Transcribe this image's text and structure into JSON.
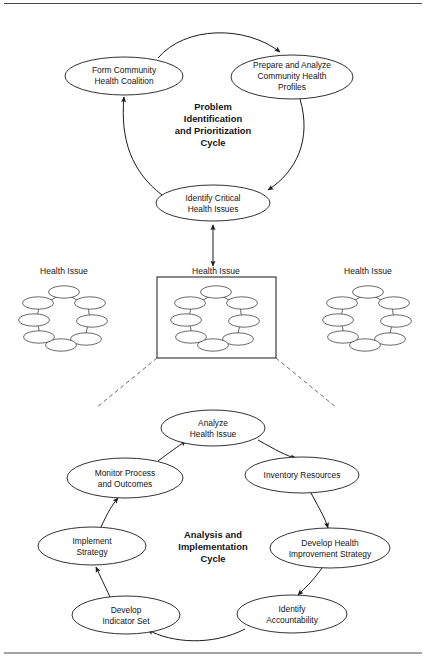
{
  "figure": {
    "top_rule": true,
    "bottom_rule": true,
    "background_color": "#ffffff",
    "line_color": "#1b1b1b"
  },
  "top_cycle": {
    "title_lines": [
      "Problem",
      "Identification",
      "and Prioritization",
      "Cycle"
    ],
    "nodes": [
      {
        "id": "form-coalition",
        "lines": [
          "Form Community",
          "Health Coalition"
        ],
        "cx": 124,
        "cy": 76,
        "rx": 59,
        "ry": 19
      },
      {
        "id": "prepare-profiles",
        "lines": [
          "Prepare and Analyze",
          "Community Health",
          "Profiles"
        ],
        "cx": 292,
        "cy": 77,
        "rx": 61,
        "ry": 22
      },
      {
        "id": "identify-critical",
        "lines": [
          "Identify Critical",
          "Health Issues"
        ],
        "cx": 213,
        "cy": 203,
        "rx": 57,
        "ry": 18
      }
    ]
  },
  "middle_row": {
    "label": "Health Issue",
    "clusters": [
      {
        "id": "health-issue-left",
        "label": "Health Issue",
        "cx": 64,
        "cy": 318,
        "boxed": false
      },
      {
        "id": "health-issue-center",
        "label": "Health Issue",
        "cx": 216,
        "cy": 318,
        "boxed": true
      },
      {
        "id": "health-issue-right",
        "label": "Health Issue",
        "cx": 368,
        "cy": 318,
        "boxed": false
      }
    ],
    "box": {
      "x": 157,
      "y": 277,
      "width": 119,
      "height": 81
    }
  },
  "bottom_cycle": {
    "title_lines": [
      "Analysis and",
      "Implementation",
      "Cycle"
    ],
    "nodes": [
      {
        "id": "analyze-health-issue",
        "lines": [
          "Analyze",
          "Health Issue"
        ],
        "cx": 213,
        "cy": 428,
        "rx": 52,
        "ry": 18
      },
      {
        "id": "inventory-resources",
        "lines": [
          "Inventory Resources"
        ],
        "cx": 302,
        "cy": 475,
        "rx": 57,
        "ry": 18
      },
      {
        "id": "develop-strategy",
        "lines": [
          "Develop Health",
          "Improvement Strategy"
        ],
        "cx": 330,
        "cy": 548,
        "rx": 60,
        "ry": 20
      },
      {
        "id": "identify-accountability",
        "lines": [
          "Identify",
          "Accountability"
        ],
        "cx": 292,
        "cy": 614,
        "rx": 55,
        "ry": 19
      },
      {
        "id": "develop-indicator-set",
        "lines": [
          "Develop",
          "Indicator Set"
        ],
        "cx": 126,
        "cy": 615,
        "rx": 54,
        "ry": 19
      },
      {
        "id": "implement-strategy",
        "lines": [
          "Implement",
          "Strategy"
        ],
        "cx": 92,
        "cy": 546,
        "rx": 54,
        "ry": 19
      },
      {
        "id": "monitor-process",
        "lines": [
          "Monitor Process",
          "and Outcomes"
        ],
        "cx": 125,
        "cy": 478,
        "rx": 58,
        "ry": 20
      }
    ]
  },
  "mini_cluster": {
    "description": "eight small ellipses arranged in a ring connected by short arrows",
    "ellipse_count": 8,
    "ellipse_rx": 15.5,
    "ellipse_ry": 6.2,
    "offsets": [
      {
        "dx": 0,
        "dy": -26
      },
      {
        "dx": 26,
        "dy": -15
      },
      {
        "dx": 28,
        "dy": 3
      },
      {
        "dx": 22,
        "dy": 21
      },
      {
        "dx": -3,
        "dy": 27
      },
      {
        "dx": -25,
        "dy": 19
      },
      {
        "dx": -30,
        "dy": 2
      },
      {
        "dx": -26,
        "dy": -15
      }
    ]
  }
}
